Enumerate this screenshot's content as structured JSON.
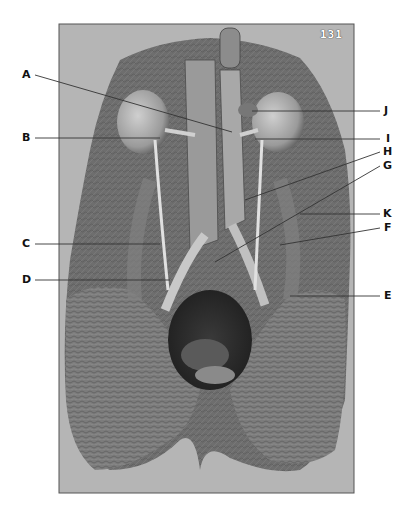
{
  "figure": {
    "page_number": "131",
    "photo_bounds": {
      "x": 59,
      "y": 24,
      "width": 295,
      "height": 469
    },
    "background_color": "#b5b5b5",
    "labels": [
      {
        "id": "A",
        "text": "A",
        "side": "left",
        "label_x": 22,
        "label_y": 69,
        "line": [
          [
            35,
            75
          ],
          [
            232,
            132
          ]
        ]
      },
      {
        "id": "B",
        "text": "B",
        "side": "left",
        "label_x": 22,
        "label_y": 132,
        "line": [
          [
            35,
            138
          ],
          [
            160,
            138
          ]
        ]
      },
      {
        "id": "C",
        "text": "C",
        "side": "left",
        "label_x": 22,
        "label_y": 238,
        "line": [
          [
            35,
            244
          ],
          [
            160,
            244
          ]
        ]
      },
      {
        "id": "D",
        "text": "D",
        "side": "left",
        "label_x": 22,
        "label_y": 274,
        "line": [
          [
            35,
            280
          ],
          [
            170,
            280
          ]
        ]
      },
      {
        "id": "J",
        "text": "J",
        "side": "right",
        "label_x": 384,
        "label_y": 105,
        "line": [
          [
            380,
            111
          ],
          [
            252,
            111
          ]
        ]
      },
      {
        "id": "I",
        "text": "I",
        "side": "right",
        "label_x": 385,
        "label_y": 133,
        "line": [
          [
            380,
            139
          ],
          [
            255,
            139
          ]
        ]
      },
      {
        "id": "H",
        "text": "H",
        "side": "right",
        "label_x": 383,
        "label_y": 146,
        "line": [
          [
            380,
            152
          ],
          [
            245,
            200
          ]
        ]
      },
      {
        "id": "G",
        "text": "G",
        "side": "right",
        "label_x": 383,
        "label_y": 160,
        "line": [
          [
            380,
            166
          ],
          [
            215,
            262
          ]
        ]
      },
      {
        "id": "K",
        "text": "K",
        "side": "right",
        "label_x": 383,
        "label_y": 208,
        "line": [
          [
            380,
            214
          ],
          [
            300,
            214
          ]
        ]
      },
      {
        "id": "F",
        "text": "F",
        "side": "right",
        "label_x": 384,
        "label_y": 222,
        "line": [
          [
            380,
            228
          ],
          [
            280,
            245
          ]
        ]
      },
      {
        "id": "E",
        "text": "E",
        "side": "right",
        "label_x": 384,
        "label_y": 290,
        "line": [
          [
            380,
            296
          ],
          [
            290,
            296
          ]
        ]
      }
    ]
  }
}
